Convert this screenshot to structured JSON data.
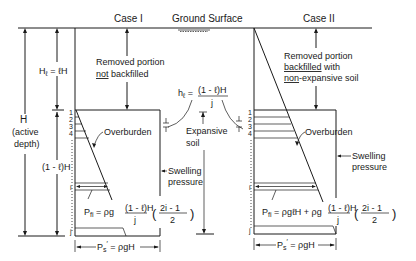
{
  "diagram": {
    "ground_surface": "Ground Surface",
    "case1": {
      "title": "Case I",
      "removed_line1": "Removed portion",
      "removed_line2_u": "not",
      "removed_line2_rest": " backfilled",
      "overburden": "Overburden",
      "swelling1": "Swelling",
      "swelling2": "pressure",
      "formula_lhs": "P",
      "formula_sub": "fi",
      "formula_eq": " = ρg ",
      "frac_num": "(1 - ℓ)H",
      "frac_den": "j",
      "paren_num": "2i - 1",
      "paren_den": "2",
      "ps_label": "P",
      "ps_sub": "s",
      "ps_prime": "′",
      "ps_rest": " = ρgH"
    },
    "case2": {
      "title": "Case II",
      "removed_line1": "Removed portion",
      "removed_line2_u": "backfilled",
      "removed_line2_rest": " with",
      "removed_line3_u": "non",
      "removed_line3_rest": "-expansive soil",
      "overburden": "Overburden",
      "swelling1": "Swelling",
      "swelling2": "pressure",
      "formula_lhs": "P",
      "formula_sub": "fi",
      "formula_eq": " = ρgℓH + ρg ",
      "frac_num": "(1 - ℓ)H",
      "frac_den": "j",
      "paren_num": "2i - 1",
      "paren_den": "2",
      "ps_label": "P",
      "ps_sub": "s",
      "ps_prime": "′",
      "ps_rest": " = ρgH"
    },
    "left_dims": {
      "H": "H",
      "active1": "(active",
      "active2": "depth)",
      "Hl_lhs": "H",
      "Hl_sub": "ℓ",
      "Hl_rest": " = ℓH",
      "rest": "(1 - ℓ)H"
    },
    "middle": {
      "hl_lhs": "h",
      "hl_sub": "ℓ",
      "hl_eq": " = ",
      "hl_num": "(1 - ℓ)H",
      "hl_den": "j",
      "expansive1": "Expansive",
      "expansive2": "soil"
    },
    "layer_labels": [
      "1",
      "2",
      "3",
      "4",
      "i",
      "j"
    ]
  }
}
